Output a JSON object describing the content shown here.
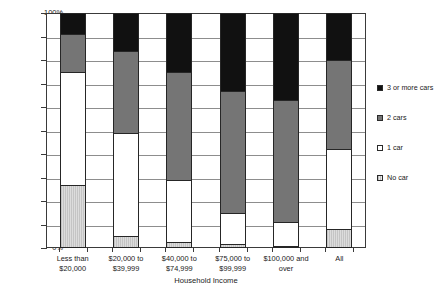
{
  "chart_data": {
    "type": "bar",
    "subtype": "stacked-bar-100-percent",
    "title": "",
    "xlabel": "Household Income",
    "ylabel": "",
    "ylim": [
      0,
      100
    ],
    "ytick_labels": [
      "0%",
      "10%",
      "20%",
      "30%",
      "40%",
      "50%",
      "60%",
      "70%",
      "80%",
      "90%",
      "100%"
    ],
    "ytick_values": [
      0,
      10,
      20,
      30,
      40,
      50,
      60,
      70,
      80,
      90,
      100
    ],
    "grid": true,
    "legend_position": "right",
    "categories": [
      "Less than\n$20,000",
      "$20,000 to\n$39,999",
      "$40,000 to\n$74,999",
      "$75,000 to\n$99,999",
      "$100,000 and\nover",
      "All"
    ],
    "categories_lines": [
      [
        "Less than",
        "$20,000"
      ],
      [
        "$20,000 to",
        "$39,999"
      ],
      [
        "$40,000 to",
        "$74,999"
      ],
      [
        "$75,000 to",
        "$99,999"
      ],
      [
        "$100,000 and",
        "over"
      ],
      [
        "All",
        ""
      ]
    ],
    "series": [
      {
        "name": "No car",
        "color": "#bfbfbf",
        "pattern": "light-gray-hatch",
        "values": [
          27,
          5,
          2.5,
          1.5,
          1,
          8
        ]
      },
      {
        "name": "1 car",
        "color": "#ffffff",
        "pattern": "white",
        "values": [
          48,
          44,
          26.5,
          13.5,
          10,
          34
        ]
      },
      {
        "name": "2 cars",
        "color": "#757575",
        "pattern": "dark-gray",
        "values": [
          16,
          35,
          46,
          52,
          52,
          38
        ]
      },
      {
        "name": "3 or more cars",
        "color": "#111111",
        "pattern": "black",
        "values": [
          9,
          16,
          25,
          33,
          37,
          20
        ]
      }
    ],
    "cumulative_tops": [
      [
        27,
        75,
        91,
        100
      ],
      [
        5,
        49,
        84,
        100
      ],
      [
        2.5,
        29,
        75,
        100
      ],
      [
        1.5,
        15,
        67,
        100
      ],
      [
        1,
        11,
        63,
        100
      ],
      [
        8,
        42,
        80,
        100
      ]
    ]
  },
  "legend": {
    "items": [
      {
        "label": "3 or more cars",
        "swatch": "black-swatch",
        "color": "#111111"
      },
      {
        "label": "2 cars",
        "swatch": "dark-gray-swatch",
        "color": "#757575"
      },
      {
        "label": "1 car",
        "swatch": "white-swatch",
        "color": "#ffffff"
      },
      {
        "label": "No car",
        "swatch": "light-gray-swatch",
        "color": "#bfbfbf"
      }
    ]
  }
}
